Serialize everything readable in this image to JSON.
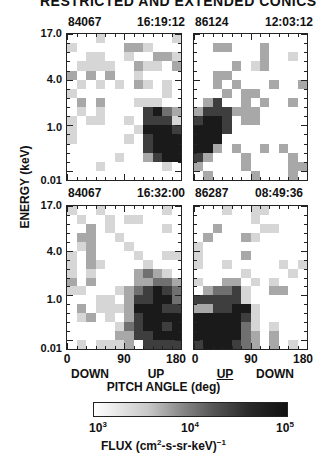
{
  "title": "RESTRICTED AND EXTENDED CONICS",
  "chart_data": {
    "type": "heatmap",
    "ylabel": "ENERGY (keV)",
    "xlabel": "PITCH ANGLE (deg)",
    "ytick_labels": [
      "17.0",
      "4.0",
      "1.0",
      "0.01"
    ],
    "colorbar": {
      "label": "FLUX (cm2-s-sr-keV)-1",
      "ticks": [
        "10^3",
        "10^4",
        "10^5"
      ],
      "range": [
        1000,
        100000
      ],
      "scale": "log"
    },
    "intensity_scale": "0=white (<=10^3) ... 5=black (>=10^5)",
    "panels": [
      {
        "id": "top-left",
        "orbit": "84067",
        "time": "16:19:12",
        "xticks": [
          "0",
          "90",
          "180"
        ],
        "direction_labels": [
          "DOWN",
          "UP"
        ],
        "grid": [
          [
            0,
            0,
            0,
            1,
            0,
            0,
            0,
            0,
            0,
            0,
            0,
            1
          ],
          [
            1,
            0,
            0,
            0,
            0,
            0,
            2,
            2,
            1,
            0,
            0,
            0
          ],
          [
            0,
            0,
            1,
            1,
            0,
            0,
            1,
            0,
            0,
            2,
            2,
            1
          ],
          [
            0,
            1,
            1,
            1,
            1,
            0,
            0,
            2,
            1,
            1,
            0,
            2
          ],
          [
            2,
            0,
            2,
            0,
            2,
            0,
            0,
            1,
            0,
            0,
            0,
            0
          ],
          [
            0,
            1,
            0,
            1,
            0,
            1,
            0,
            2,
            1,
            0,
            1,
            0
          ],
          [
            1,
            0,
            0,
            0,
            0,
            0,
            0,
            0,
            0,
            0,
            1,
            0
          ],
          [
            0,
            2,
            0,
            2,
            0,
            0,
            0,
            1,
            1,
            1,
            0,
            0
          ],
          [
            0,
            1,
            0,
            1,
            0,
            0,
            0,
            0,
            4,
            5,
            3,
            2
          ],
          [
            1,
            0,
            1,
            1,
            0,
            0,
            1,
            0,
            4,
            4,
            4,
            1
          ],
          [
            1,
            0,
            0,
            0,
            0,
            0,
            0,
            1,
            5,
            5,
            5,
            4
          ],
          [
            1,
            0,
            0,
            0,
            0,
            0,
            1,
            0,
            4,
            5,
            5,
            5
          ],
          [
            0,
            0,
            0,
            0,
            0,
            0,
            0,
            0,
            4,
            5,
            5,
            5
          ],
          [
            0,
            0,
            0,
            0,
            0,
            1,
            0,
            0,
            2,
            4,
            5,
            5
          ],
          [
            0,
            0,
            0,
            1,
            0,
            0,
            0,
            0,
            0,
            0,
            1,
            0
          ],
          [
            0,
            0,
            0,
            0,
            0,
            0,
            0,
            0,
            0,
            0,
            0,
            0
          ]
        ]
      },
      {
        "id": "top-right",
        "orbit": "86124",
        "time": "12:03:12",
        "xticks": [
          "0",
          "90",
          "180"
        ],
        "direction_labels": [
          "UP",
          "DOWN"
        ],
        "grid": [
          [
            0,
            0,
            0,
            0,
            0,
            0,
            0,
            0,
            0,
            0,
            0,
            0
          ],
          [
            0,
            0,
            2,
            2,
            0,
            0,
            0,
            2,
            0,
            0,
            0,
            0
          ],
          [
            0,
            0,
            0,
            0,
            0,
            0,
            0,
            2,
            0,
            0,
            1,
            0
          ],
          [
            0,
            0,
            0,
            0,
            2,
            0,
            1,
            2,
            0,
            0,
            0,
            0
          ],
          [
            0,
            0,
            2,
            2,
            0,
            0,
            0,
            0,
            0,
            0,
            0,
            0
          ],
          [
            0,
            0,
            2,
            0,
            2,
            0,
            0,
            0,
            2,
            0,
            0,
            2
          ],
          [
            0,
            0,
            0,
            2,
            0,
            2,
            2,
            0,
            0,
            0,
            0,
            0
          ],
          [
            0,
            2,
            4,
            0,
            0,
            2,
            0,
            2,
            0,
            0,
            2,
            0
          ],
          [
            2,
            4,
            4,
            4,
            2,
            2,
            2,
            0,
            0,
            0,
            0,
            0
          ],
          [
            4,
            5,
            5,
            4,
            0,
            2,
            2,
            0,
            0,
            0,
            0,
            0
          ],
          [
            5,
            5,
            5,
            4,
            0,
            0,
            0,
            0,
            0,
            0,
            0,
            0
          ],
          [
            5,
            5,
            5,
            0,
            0,
            0,
            0,
            0,
            0,
            0,
            0,
            0
          ],
          [
            5,
            5,
            2,
            0,
            2,
            0,
            0,
            2,
            0,
            2,
            0,
            0
          ],
          [
            4,
            2,
            0,
            0,
            0,
            2,
            0,
            0,
            0,
            0,
            2,
            0
          ],
          [
            2,
            0,
            0,
            0,
            0,
            2,
            0,
            0,
            0,
            0,
            2,
            2
          ],
          [
            0,
            2,
            0,
            0,
            0,
            0,
            2,
            0,
            0,
            0,
            2,
            0
          ]
        ]
      },
      {
        "id": "bottom-left",
        "orbit": "84067",
        "time": "16:32:00",
        "xticks": [
          "0",
          "90",
          "180"
        ],
        "direction_labels": [
          "DOWN",
          "UP"
        ],
        "grid": [
          [
            1,
            0,
            0,
            1,
            0,
            0,
            0,
            0,
            0,
            0,
            1,
            0
          ],
          [
            0,
            1,
            0,
            0,
            1,
            0,
            1,
            1,
            0,
            0,
            0,
            0
          ],
          [
            0,
            0,
            2,
            0,
            1,
            0,
            0,
            0,
            0,
            0,
            1,
            0
          ],
          [
            0,
            2,
            2,
            0,
            0,
            1,
            0,
            0,
            0,
            0,
            0,
            0
          ],
          [
            0,
            1,
            2,
            0,
            0,
            0,
            1,
            0,
            0,
            0,
            0,
            0
          ],
          [
            1,
            0,
            2,
            0,
            0,
            0,
            0,
            1,
            0,
            0,
            1,
            1
          ],
          [
            1,
            0,
            2,
            1,
            0,
            0,
            0,
            0,
            1,
            0,
            0,
            0
          ],
          [
            1,
            0,
            1,
            0,
            0,
            0,
            0,
            2,
            3,
            2,
            1,
            0
          ],
          [
            2,
            0,
            2,
            0,
            0,
            0,
            0,
            2,
            2,
            3,
            3,
            2
          ],
          [
            1,
            1,
            0,
            0,
            0,
            1,
            2,
            3,
            4,
            5,
            4,
            3
          ],
          [
            0,
            0,
            0,
            1,
            1,
            0,
            2,
            4,
            4,
            5,
            5,
            3
          ],
          [
            0,
            2,
            0,
            1,
            1,
            1,
            2,
            5,
            5,
            5,
            4,
            4
          ],
          [
            0,
            1,
            2,
            0,
            1,
            0,
            2,
            4,
            5,
            5,
            5,
            5
          ],
          [
            0,
            0,
            0,
            0,
            0,
            1,
            3,
            4,
            5,
            5,
            4,
            5
          ],
          [
            0,
            0,
            0,
            0,
            0,
            2,
            2,
            4,
            4,
            5,
            5,
            5
          ],
          [
            0,
            1,
            0,
            1,
            1,
            1,
            2,
            0,
            4,
            4,
            4,
            4
          ]
        ]
      },
      {
        "id": "bottom-right",
        "orbit": "86287",
        "time": "08:49:36",
        "xticks": [
          "0",
          "90",
          "180"
        ],
        "direction_labels": [
          "UP",
          "DOWN"
        ],
        "grid": [
          [
            0,
            0,
            0,
            1,
            0,
            0,
            1,
            1,
            0,
            0,
            0,
            0
          ],
          [
            0,
            0,
            0,
            0,
            0,
            0,
            1,
            0,
            0,
            0,
            0,
            0
          ],
          [
            0,
            0,
            2,
            0,
            0,
            0,
            0,
            1,
            1,
            0,
            0,
            0
          ],
          [
            0,
            2,
            0,
            0,
            0,
            2,
            1,
            0,
            0,
            0,
            0,
            0
          ],
          [
            1,
            0,
            0,
            0,
            0,
            0,
            0,
            0,
            0,
            0,
            0,
            0
          ],
          [
            1,
            0,
            0,
            0,
            0,
            2,
            0,
            0,
            0,
            0,
            0,
            0
          ],
          [
            1,
            0,
            0,
            1,
            0,
            0,
            0,
            0,
            0,
            1,
            0,
            1
          ],
          [
            0,
            0,
            0,
            0,
            0,
            1,
            0,
            0,
            0,
            0,
            1,
            0
          ],
          [
            1,
            0,
            0,
            2,
            2,
            0,
            1,
            0,
            1,
            0,
            0,
            0
          ],
          [
            0,
            2,
            3,
            3,
            4,
            1,
            0,
            0,
            2,
            2,
            0,
            0
          ],
          [
            4,
            4,
            4,
            4,
            4,
            1,
            0,
            0,
            0,
            0,
            0,
            0
          ],
          [
            2,
            2,
            4,
            4,
            5,
            5,
            1,
            0,
            0,
            0,
            0,
            0
          ],
          [
            5,
            5,
            5,
            5,
            5,
            4,
            1,
            0,
            0,
            0,
            0,
            0
          ],
          [
            5,
            5,
            5,
            5,
            5,
            3,
            1,
            0,
            1,
            0,
            0,
            0
          ],
          [
            5,
            5,
            5,
            5,
            5,
            3,
            2,
            0,
            2,
            0,
            0,
            0
          ],
          [
            4,
            5,
            5,
            5,
            4,
            3,
            2,
            0,
            2,
            0,
            1,
            0
          ]
        ]
      }
    ]
  },
  "colors": {
    "levels": [
      "#ffffff",
      "#d6d6d6",
      "#a8a8a8",
      "#707070",
      "#3e3e3e",
      "#1a1a1a"
    ],
    "axis": "#222222"
  },
  "axis": {
    "ylabel": "ENERGY (keV)",
    "xlabel": "PITCH ANGLE (deg)",
    "yticks": [
      "17.0",
      "4.0",
      "1.0",
      "0.01"
    ],
    "xticks": [
      "0",
      "90",
      "180"
    ]
  },
  "panels_text": {
    "tl": {
      "orbit": "84067",
      "time": "16:19:12"
    },
    "tr": {
      "orbit": "86124",
      "time": "12:03:12"
    },
    "bl": {
      "orbit": "84067",
      "time": "16:32:00"
    },
    "br": {
      "orbit": "86287",
      "time": "08:49:36"
    }
  },
  "direction": {
    "left": [
      "DOWN",
      "UP"
    ],
    "right": [
      "UP",
      "DOWN"
    ]
  },
  "colorbar": {
    "tick_base": "10",
    "tick_exps": [
      "3",
      "4",
      "5"
    ],
    "label_prefix": "FLUX (cm",
    "label_sup1": "2",
    "label_mid": "-s-sr-keV)",
    "label_sup2": "−1"
  }
}
